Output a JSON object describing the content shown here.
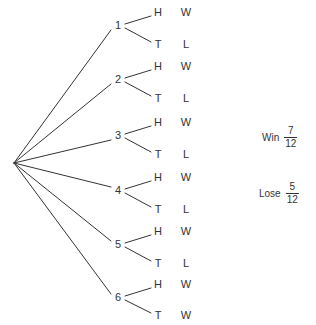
{
  "diagram": {
    "type": "probability-tree",
    "root": {
      "x": 14,
      "y": 163
    },
    "branches": [
      {
        "label": "1",
        "x": 118,
        "y": 26,
        "children": [
          {
            "flip": "H",
            "outcome": "W",
            "x_flip": 158,
            "x_outcome": 186,
            "y": 13
          },
          {
            "flip": "T",
            "outcome": "L",
            "x_flip": 158,
            "x_outcome": 186,
            "y": 45
          }
        ]
      },
      {
        "label": "2",
        "x": 118,
        "y": 80,
        "children": [
          {
            "flip": "H",
            "outcome": "W",
            "x_flip": 158,
            "x_outcome": 186,
            "y": 67
          },
          {
            "flip": "T",
            "outcome": "L",
            "x_flip": 158,
            "x_outcome": 186,
            "y": 99
          }
        ]
      },
      {
        "label": "3",
        "x": 118,
        "y": 136,
        "children": [
          {
            "flip": "H",
            "outcome": "W",
            "x_flip": 158,
            "x_outcome": 186,
            "y": 123
          },
          {
            "flip": "T",
            "outcome": "L",
            "x_flip": 158,
            "x_outcome": 186,
            "y": 155
          }
        ]
      },
      {
        "label": "4",
        "x": 118,
        "y": 191,
        "children": [
          {
            "flip": "H",
            "outcome": "W",
            "x_flip": 158,
            "x_outcome": 186,
            "y": 178
          },
          {
            "flip": "T",
            "outcome": "L",
            "x_flip": 158,
            "x_outcome": 186,
            "y": 210
          }
        ]
      },
      {
        "label": "5",
        "x": 118,
        "y": 245,
        "children": [
          {
            "flip": "H",
            "outcome": "W",
            "x_flip": 158,
            "x_outcome": 186,
            "y": 232
          },
          {
            "flip": "T",
            "outcome": "L",
            "x_flip": 158,
            "x_outcome": 186,
            "y": 264
          }
        ]
      },
      {
        "label": "6",
        "x": 118,
        "y": 298,
        "children": [
          {
            "flip": "H",
            "outcome": "W",
            "x_flip": 158,
            "x_outcome": 186,
            "y": 285
          },
          {
            "flip": "T",
            "outcome": "W",
            "x_flip": 158,
            "x_outcome": 186,
            "y": 316
          }
        ]
      }
    ]
  },
  "summary": [
    {
      "label": "Win",
      "numerator": "7",
      "denominator": "12",
      "x": 262,
      "y": 136
    },
    {
      "label": "Lose",
      "numerator": "5",
      "denominator": "12",
      "x": 259,
      "y": 192
    }
  ],
  "style": {
    "line_color": "#333333",
    "text_color": "#333333",
    "background": "#ffffff"
  }
}
